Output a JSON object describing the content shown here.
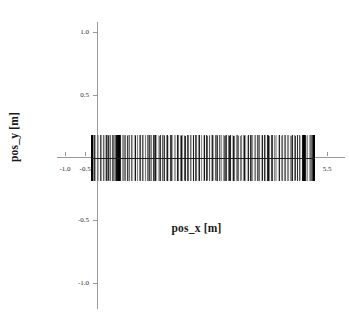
{
  "chart_data": {
    "type": "scatter",
    "title": "",
    "xlabel": "pos_x [m]",
    "ylabel": "pos_y [m]",
    "xlim": [
      -1.25,
      5.75
    ],
    "ylim": [
      -1.25,
      1.25
    ],
    "grid": false,
    "legend": null,
    "xticks": [
      -1.0,
      -0.5,
      0.5,
      1.0,
      1.5,
      2.0,
      2.5,
      3.0,
      3.5,
      4.0,
      4.5,
      5.0,
      5.5
    ],
    "xticklabels": [
      "-1.0",
      "-0.5",
      "0.5",
      "1.0",
      "1.5",
      "2.0",
      "2.5",
      "3.0",
      "3.5",
      "4.0",
      "4.5",
      "5.0",
      "5.5"
    ],
    "yticks": [
      -1.0,
      -0.5,
      0.5,
      1.0
    ],
    "yticklabels": [
      "-1.0",
      "-0.5",
      "0.5",
      "1.0"
    ],
    "series": [
      {
        "name": "trajectory",
        "color": "#000000",
        "description": "dense set of near-vertical line segments spanning the band",
        "x_range": [
          -0.35,
          5.2
        ],
        "y_range": [
          -0.19,
          0.18
        ],
        "segments": [
          {
            "x": -0.34,
            "y0": -0.19,
            "y1": 0.18,
            "shade": 0.25
          },
          {
            "x": -0.31,
            "y0": -0.19,
            "y1": 0.18,
            "shade": 0.45
          },
          {
            "x": -0.28,
            "y0": -0.19,
            "y1": 0.18,
            "shade": 0.8
          },
          {
            "x": -0.25,
            "y0": -0.19,
            "y1": 0.18,
            "shade": 0.35
          },
          {
            "x": -0.21,
            "y0": -0.19,
            "y1": 0.18,
            "shade": 0.55
          },
          {
            "x": -0.17,
            "y0": -0.19,
            "y1": 0.18,
            "shade": 0.3
          },
          {
            "x": -0.13,
            "y0": -0.19,
            "y1": 0.18,
            "shade": 0.7
          },
          {
            "x": -0.09,
            "y0": -0.19,
            "y1": 0.18,
            "shade": 0.4
          },
          {
            "x": -0.05,
            "y0": -0.19,
            "y1": 0.18,
            "shade": 0.6
          },
          {
            "x": 0.0,
            "y0": -0.19,
            "y1": 0.18,
            "shade": 0.3
          },
          {
            "x": 0.05,
            "y0": -0.19,
            "y1": 0.18,
            "shade": 0.5
          },
          {
            "x": 0.1,
            "y0": -0.19,
            "y1": 0.18,
            "shade": 0.35
          },
          {
            "x": 0.16,
            "y0": -0.19,
            "y1": 0.18,
            "shade": 0.65
          },
          {
            "x": 0.22,
            "y0": -0.19,
            "y1": 0.18,
            "shade": 0.4
          },
          {
            "x": 0.28,
            "y0": -0.19,
            "y1": 0.18,
            "shade": 0.95
          },
          {
            "x": 0.31,
            "y0": -0.19,
            "y1": 0.18,
            "shade": 1.0
          },
          {
            "x": 0.34,
            "y0": -0.19,
            "y1": 0.18,
            "shade": 1.0
          },
          {
            "x": 0.38,
            "y0": -0.19,
            "y1": 0.18,
            "shade": 0.85
          },
          {
            "x": 0.44,
            "y0": -0.19,
            "y1": 0.18,
            "shade": 0.45
          },
          {
            "x": 0.5,
            "y0": -0.19,
            "y1": 0.18,
            "shade": 0.55
          },
          {
            "x": 0.57,
            "y0": -0.19,
            "y1": 0.18,
            "shade": 0.35
          },
          {
            "x": 0.64,
            "y0": -0.19,
            "y1": 0.18,
            "shade": 0.6
          },
          {
            "x": 0.71,
            "y0": -0.19,
            "y1": 0.18,
            "shade": 0.3
          },
          {
            "x": 0.79,
            "y0": -0.19,
            "y1": 0.18,
            "shade": 0.5
          },
          {
            "x": 0.87,
            "y0": -0.19,
            "y1": 0.18,
            "shade": 0.7
          },
          {
            "x": 0.95,
            "y0": -0.19,
            "y1": 0.18,
            "shade": 0.35
          },
          {
            "x": 1.03,
            "y0": -0.19,
            "y1": 0.18,
            "shade": 0.55
          },
          {
            "x": 1.12,
            "y0": -0.19,
            "y1": 0.18,
            "shade": 0.4
          },
          {
            "x": 1.21,
            "y0": -0.19,
            "y1": 0.18,
            "shade": 0.65
          },
          {
            "x": 1.3,
            "y0": -0.19,
            "y1": 0.18,
            "shade": 0.3
          },
          {
            "x": 1.4,
            "y0": -0.19,
            "y1": 0.18,
            "shade": 0.6
          },
          {
            "x": 1.5,
            "y0": -0.19,
            "y1": 0.18,
            "shade": 0.45
          },
          {
            "x": 1.6,
            "y0": -0.19,
            "y1": 0.18,
            "shade": 0.75
          },
          {
            "x": 1.7,
            "y0": -0.19,
            "y1": 0.18,
            "shade": 0.35
          },
          {
            "x": 1.81,
            "y0": -0.19,
            "y1": 0.18,
            "shade": 0.55
          },
          {
            "x": 1.92,
            "y0": -0.19,
            "y1": 0.18,
            "shade": 0.4
          },
          {
            "x": 2.03,
            "y0": -0.19,
            "y1": 0.18,
            "shade": 0.7
          },
          {
            "x": 2.14,
            "y0": -0.19,
            "y1": 0.18,
            "shade": 0.3
          },
          {
            "x": 2.26,
            "y0": -0.19,
            "y1": 0.18,
            "shade": 0.6
          },
          {
            "x": 2.38,
            "y0": -0.19,
            "y1": 0.18,
            "shade": 0.45
          },
          {
            "x": 2.5,
            "y0": -0.19,
            "y1": 0.18,
            "shade": 0.8
          },
          {
            "x": 2.62,
            "y0": -0.19,
            "y1": 0.18,
            "shade": 0.35
          },
          {
            "x": 2.75,
            "y0": -0.19,
            "y1": 0.18,
            "shade": 0.55
          },
          {
            "x": 2.88,
            "y0": -0.19,
            "y1": 0.18,
            "shade": 0.4
          },
          {
            "x": 3.01,
            "y0": -0.19,
            "y1": 0.18,
            "shade": 0.75
          },
          {
            "x": 3.14,
            "y0": -0.19,
            "y1": 0.18,
            "shade": 0.3
          },
          {
            "x": 3.27,
            "y0": -0.19,
            "y1": 0.18,
            "shade": 0.6
          },
          {
            "x": 3.41,
            "y0": -0.19,
            "y1": 0.18,
            "shade": 0.45
          },
          {
            "x": 3.55,
            "y0": -0.19,
            "y1": 0.18,
            "shade": 0.85
          },
          {
            "x": 3.69,
            "y0": -0.19,
            "y1": 0.18,
            "shade": 0.35
          },
          {
            "x": 3.83,
            "y0": -0.19,
            "y1": 0.18,
            "shade": 0.55
          },
          {
            "x": 3.97,
            "y0": -0.19,
            "y1": 0.18,
            "shade": 0.4
          },
          {
            "x": 4.11,
            "y0": -0.19,
            "y1": 0.18,
            "shade": 0.7
          },
          {
            "x": 4.25,
            "y0": -0.19,
            "y1": 0.18,
            "shade": 0.3
          },
          {
            "x": 4.4,
            "y0": -0.19,
            "y1": 0.18,
            "shade": 0.6
          },
          {
            "x": 4.54,
            "y0": -0.19,
            "y1": 0.18,
            "shade": 0.45
          },
          {
            "x": 4.68,
            "y0": -0.19,
            "y1": 0.18,
            "shade": 0.5
          },
          {
            "x": 4.8,
            "y0": -0.19,
            "y1": 0.18,
            "shade": 0.65
          },
          {
            "x": 4.88,
            "y0": -0.19,
            "y1": 0.18,
            "shade": 0.9
          },
          {
            "x": 4.92,
            "y0": -0.19,
            "y1": 0.18,
            "shade": 1.0
          },
          {
            "x": 4.96,
            "y0": -0.19,
            "y1": 0.18,
            "shade": 0.85
          },
          {
            "x": 5.02,
            "y0": -0.19,
            "y1": 0.18,
            "shade": 0.4
          },
          {
            "x": 5.08,
            "y0": -0.19,
            "y1": 0.18,
            "shade": 0.55
          },
          {
            "x": 5.14,
            "y0": -0.19,
            "y1": 0.18,
            "shade": 0.75
          },
          {
            "x": 5.19,
            "y0": -0.19,
            "y1": 0.18,
            "shade": 1.0
          }
        ]
      }
    ]
  },
  "style": {
    "axis_color": "#9a9a9a",
    "data_color": "#000000",
    "text_color": "#1a1a1a",
    "background": "#ffffff"
  }
}
